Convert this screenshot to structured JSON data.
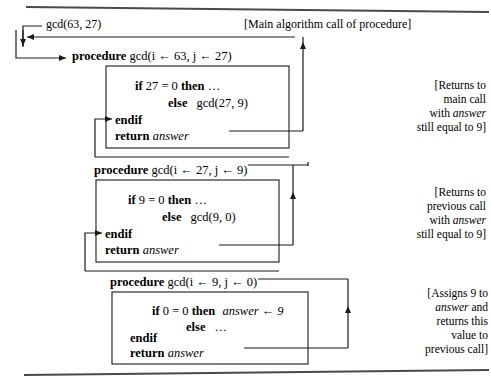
{
  "figure": {
    "title_rule_top": true,
    "title_rule_bottom": true,
    "ink_color": "#1a1a1a",
    "background_color": "#ffffff"
  },
  "main_call": {
    "label": "gcd(63, 27)",
    "annotation": "[Main algorithm call of procedure]"
  },
  "frames": [
    {
      "id": "frame-1",
      "procedure_keyword": "procedure",
      "signature": "gcd(i ← 63, j ← 27)",
      "if_line": "if 27 = 0 then …",
      "if_keyword_1": "if",
      "if_condition": "27 = 0",
      "then_keyword": "then",
      "then_body": "…",
      "else_keyword": "else",
      "else_body": "gcd(27, 9)",
      "endif_keyword": "endif",
      "return_keyword": "return",
      "return_value": "answer",
      "annotation_lines": [
        "[Returns to",
        "main call",
        "with answer",
        "still equal to 9]"
      ],
      "annotation_italic_word": "answer"
    },
    {
      "id": "frame-2",
      "procedure_keyword": "procedure",
      "signature": "gcd(i ← 27, j ← 9)",
      "if_line": "if 9 = 0 then …",
      "if_keyword_1": "if",
      "if_condition": "9 = 0",
      "then_keyword": "then",
      "then_body": "…",
      "else_keyword": "else",
      "else_body": "gcd(9, 0)",
      "endif_keyword": "endif",
      "return_keyword": "return",
      "return_value": "answer",
      "annotation_lines": [
        "[Returns to",
        "previous call",
        "with answer",
        "still equal to 9]"
      ],
      "annotation_italic_word": "answer"
    },
    {
      "id": "frame-3",
      "procedure_keyword": "procedure",
      "signature": "gcd(i ← 9, j ← 0)",
      "if_line": "if 0 = 0 then answer ← 9",
      "if_keyword_1": "if",
      "if_condition": "0 = 0",
      "then_keyword": "then",
      "then_body": "answer ← 9",
      "else_keyword": "else",
      "else_body": "…",
      "endif_keyword": "endif",
      "return_keyword": "return",
      "return_value": "answer",
      "annotation_lines": [
        "[Assigns 9 to",
        "answer and",
        "returns this",
        "value to",
        "previous call]"
      ],
      "annotation_italic_word": "answer"
    }
  ],
  "glyphs": {
    "left_arrow": "←",
    "ellipsis": "…"
  }
}
